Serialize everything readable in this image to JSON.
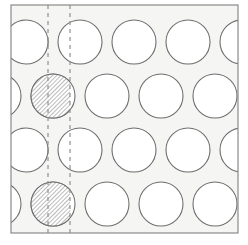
{
  "figure": {
    "type": "technical-diagram",
    "canvas": {
      "width": 248,
      "height": 245,
      "background": "#ffffff"
    }
  },
  "panel": {
    "name": "plate-outline",
    "x": 11,
    "y": 5,
    "width": 227,
    "height": 228,
    "fill": "#f5f5f3",
    "stroke": "#8a8a8a",
    "stroke_width": 1.2
  },
  "geometry": {
    "circle_diameter": 44,
    "circle_radius": 22,
    "column_pitch": 54,
    "row_pitch": 54,
    "row_stagger_offset": -27,
    "circle_fill": "#ffffff",
    "circle_stroke": "#6e6e6e",
    "circle_stroke_width": 1.1
  },
  "dashed_lines": {
    "stroke": "#909090",
    "stroke_width": 1.2,
    "dash_pattern": "4 4",
    "positions": [
      {
        "id": "unit-cell-line-left",
        "x": 48
      },
      {
        "id": "unit-cell-line-right",
        "x": 70
      }
    ]
  },
  "hatching": {
    "stroke": "#3c3c3c",
    "stroke_width": 0.7,
    "spacing": 3,
    "angle_deg": 45,
    "background": "#ffffff"
  },
  "rows": [
    {
      "id": "row-1",
      "index": 1,
      "center_y": 42,
      "offset": 0,
      "centers_x": [
        26,
        80,
        134,
        188,
        242
      ],
      "hatched_circle_center_x": 26,
      "hatched_side": "right",
      "hatch_boundary_x": 48
    },
    {
      "id": "row-2",
      "index": 2,
      "center_y": 96,
      "offset": -27,
      "centers_x": [
        -1,
        53,
        107,
        161,
        215
      ],
      "hatched_circle_center_x": 53,
      "hatched_side": "left",
      "hatch_boundary_x": 70
    },
    {
      "id": "row-3",
      "index": 3,
      "center_y": 150,
      "offset": 0,
      "centers_x": [
        26,
        80,
        134,
        188,
        242
      ],
      "hatched_circle_center_x": 26,
      "hatched_side": "right",
      "hatch_boundary_x": 48
    },
    {
      "id": "row-4",
      "index": 4,
      "center_y": 204,
      "offset": -27,
      "centers_x": [
        -1,
        53,
        107,
        161,
        215
      ],
      "hatched_circle_center_x": 53,
      "hatched_side": "left",
      "hatch_boundary_x": 70
    }
  ],
  "labels": {
    "has_text_labels": false,
    "items": []
  }
}
